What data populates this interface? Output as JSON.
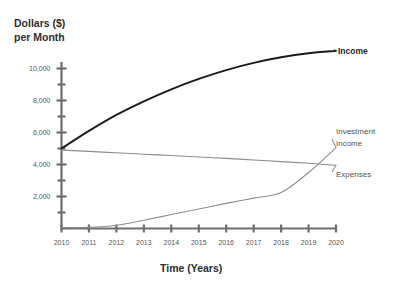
{
  "chart_data": {
    "type": "line",
    "title": "",
    "ylabel": "Dollars ($) per Month",
    "ylabel_line1": "Dollars ($)",
    "ylabel_line2": "per Month",
    "xlabel": "Time (Years)",
    "x": [
      2010,
      2011,
      2012,
      2013,
      2014,
      2015,
      2016,
      2017,
      2018,
      2019,
      2020
    ],
    "xtick_labels": [
      "2010",
      "2011",
      "2012",
      "2013",
      "2014",
      "2015",
      "2016",
      "2017",
      "2018",
      "2019",
      "2020"
    ],
    "xlim": [
      2010,
      2020
    ],
    "ylim": [
      0,
      11000
    ],
    "ytick_labels": [
      "2,000",
      "4,000",
      "6,000",
      "8,000",
      "10,000"
    ],
    "ytick_values": [
      2000,
      4000,
      6000,
      8000,
      10000
    ],
    "yminor_values": [
      1000,
      3000,
      5000,
      7000,
      9000,
      11000
    ],
    "grid": false,
    "legend_position": "right-inline-labels",
    "series": [
      {
        "name": "Income",
        "label": "Income",
        "color": "#1a1a1a",
        "values": [
          5000,
          6100,
          7100,
          7950,
          8700,
          9350,
          9900,
          10350,
          10700,
          10950,
          11100
        ]
      },
      {
        "name": "Expenses",
        "label": "Expenses",
        "color": "#8d8d8d",
        "values": [
          4900,
          4820,
          4730,
          4640,
          4560,
          4470,
          4380,
          4280,
          4180,
          4080,
          3950
        ]
      },
      {
        "name": "Investment Income",
        "label": "Investment Income",
        "label_line1": "Investment",
        "label_line2": "Income",
        "color": "#8d8d8d",
        "values": [
          60,
          70,
          200,
          520,
          870,
          1220,
          1570,
          1900,
          2250,
          3500,
          5050
        ]
      }
    ]
  }
}
